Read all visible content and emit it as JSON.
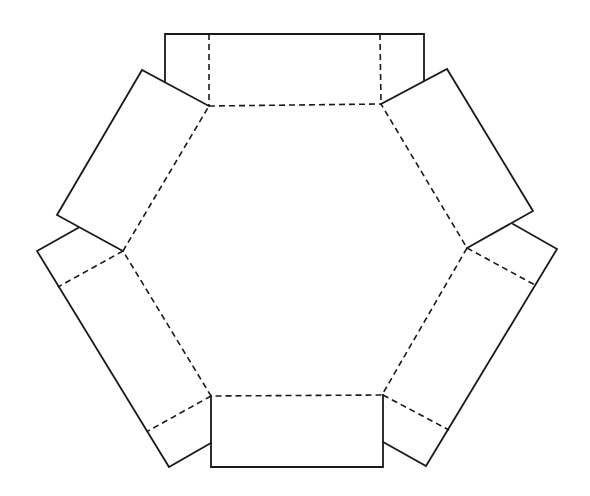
{
  "diagram": {
    "type": "hexagonal box net",
    "colors": {
      "background": "#ffffff",
      "line": "#1a1a1a"
    },
    "legend": {
      "solid_line": "cut",
      "dashed_line": "fold"
    },
    "base_hexagon": {
      "vertices": [
        [
          209,
          106
        ],
        [
          381,
          104
        ],
        [
          467,
          248
        ],
        [
          382,
          395
        ],
        [
          211,
          396
        ],
        [
          123,
          251
        ]
      ]
    },
    "top_flap": {
      "outline": [
        [
          165,
          81
        ],
        [
          165,
          34
        ],
        [
          424,
          34
        ],
        [
          424,
          80
        ]
      ],
      "fold_lines": [
        [
          [
            209,
            34
          ],
          [
            209,
            106
          ]
        ],
        [
          [
            380,
            34
          ],
          [
            381,
            104
          ]
        ]
      ]
    },
    "upper_left_panel": {
      "outline": [
        [
          209,
          106
        ],
        [
          142,
          70
        ],
        [
          57,
          215
        ],
        [
          123,
          251
        ]
      ]
    },
    "upper_right_panel": {
      "outline": [
        [
          381,
          104
        ],
        [
          447,
          69
        ],
        [
          533,
          211
        ],
        [
          467,
          248
        ]
      ]
    },
    "lower_left_panel": {
      "outline": [
        [
          78,
          228
        ],
        [
          37,
          251
        ],
        [
          169,
          467
        ],
        [
          211,
          443
        ]
      ],
      "fold_lines": [
        [
          [
            123,
            251
          ],
          [
            58,
            287
          ]
        ],
        [
          [
            211,
            396
          ],
          [
            148,
            431
          ]
        ]
      ]
    },
    "lower_right_panel": {
      "outline": [
        [
          513,
          224
        ],
        [
          557,
          249
        ],
        [
          426,
          466
        ],
        [
          383,
          442
        ]
      ],
      "fold_lines": [
        [
          [
            467,
            248
          ],
          [
            535,
            285
          ]
        ],
        [
          [
            383,
            395
          ],
          [
            449,
            430
          ]
        ]
      ]
    },
    "bottom_flap": {
      "outline": [
        [
          211,
          396
        ],
        [
          211,
          467
        ],
        [
          383,
          467
        ],
        [
          383,
          395
        ]
      ]
    }
  }
}
